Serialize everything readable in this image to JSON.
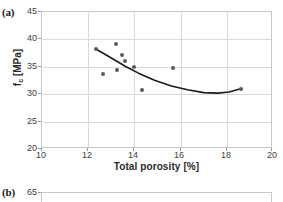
{
  "figure": {
    "panel_a_label": "(a)",
    "panel_b_label": "(b)"
  },
  "chart_data": [
    {
      "panel": "(a)",
      "type": "scatter",
      "title": "",
      "xlabel": "Total porosity [%]",
      "ylabel": "f_c [MPa]",
      "ylabel_base": "f",
      "ylabel_sub": "c",
      "ylabel_unit": " [MPa]",
      "xlim": [
        10,
        20
      ],
      "ylim": [
        20,
        45
      ],
      "xticks": [
        10,
        12,
        14,
        16,
        18,
        20
      ],
      "yticks": [
        20,
        25,
        30,
        35,
        40,
        45
      ],
      "xtick_labels": [
        "10",
        "12",
        "14",
        "16",
        "18",
        "20"
      ],
      "ytick_labels": [
        "20",
        "25",
        "30",
        "35",
        "40",
        "45"
      ],
      "grid": true,
      "legend": "none",
      "marker_color": "#5a5a5a",
      "curve_color": "#1a1a1a",
      "grid_color": "#d9d9d9",
      "points": [
        {
          "x": 12.35,
          "y": 38.2
        },
        {
          "x": 12.65,
          "y": 33.7
        },
        {
          "x": 13.2,
          "y": 39.2
        },
        {
          "x": 13.25,
          "y": 34.4
        },
        {
          "x": 13.45,
          "y": 37.2
        },
        {
          "x": 13.6,
          "y": 36.0
        },
        {
          "x": 14.0,
          "y": 35.0
        },
        {
          "x": 14.35,
          "y": 30.8
        },
        {
          "x": 15.65,
          "y": 34.7
        },
        {
          "x": 18.6,
          "y": 31.0
        }
      ],
      "fit_curve": {
        "label": "polynomial trend line",
        "x": [
          12.35,
          13.0,
          13.6,
          14.2,
          14.9,
          15.6,
          16.3,
          17.0,
          17.6,
          18.1,
          18.6
        ],
        "y": [
          38.2,
          36.6,
          35.1,
          33.8,
          32.5,
          31.5,
          30.8,
          30.3,
          30.2,
          30.4,
          31.0
        ]
      }
    },
    {
      "panel": "(b)",
      "type": "scatter",
      "note": "only top edge visible in crop",
      "ytick_labels": [
        "65"
      ],
      "ylim_top": 65
    }
  ]
}
